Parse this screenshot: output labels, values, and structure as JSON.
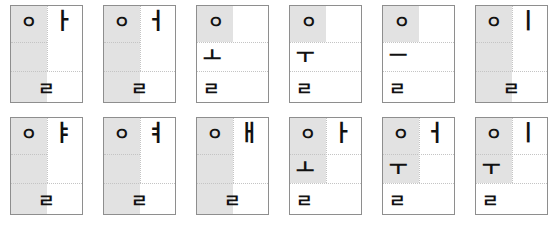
{
  "figure": {
    "rows": 2,
    "columns": 6,
    "shade_color": "#e2e2e2",
    "border_color": "#8e8e8e",
    "guide_color": "#c4c4c4",
    "glyph_color": "#111111"
  },
  "cells": [
    {
      "id": "r1c1",
      "initial": "ㅇ",
      "vowel": "ㅏ",
      "final": "ㄹ",
      "vowel_position": "right",
      "shade": "quad"
    },
    {
      "id": "r1c2",
      "initial": "ㅇ",
      "vowel": "ㅓ",
      "final": "ㄹ",
      "vowel_position": "right",
      "shade": "quad"
    },
    {
      "id": "r1c3",
      "initial": "ㅇ",
      "vowel": "ㅗ",
      "final": "ㄹ",
      "vowel_position": "below",
      "shade": "band-left"
    },
    {
      "id": "r1c4",
      "initial": "ㅇ",
      "vowel": "ㅜ",
      "final": "ㄹ",
      "vowel_position": "below",
      "shade": "band-left"
    },
    {
      "id": "r1c5",
      "initial": "ㅇ",
      "vowel": "ㅡ",
      "final": "ㄹ",
      "vowel_position": "below",
      "shade": "band-left"
    },
    {
      "id": "r1c6",
      "initial": "ㅇ",
      "vowel": "ㅣ",
      "final": "ㄹ",
      "vowel_position": "right",
      "shade": "quad"
    },
    {
      "id": "r2c1",
      "initial": "ㅇ",
      "vowel": "ㅑ",
      "final": "ㄹ",
      "vowel_position": "right",
      "shade": "quad"
    },
    {
      "id": "r2c2",
      "initial": "ㅇ",
      "vowel": "ㅕ",
      "final": "ㄹ",
      "vowel_position": "right",
      "shade": "quad"
    },
    {
      "id": "r2c3",
      "initial": "ㅇ",
      "vowel": "ㅐ",
      "final": "ㄹ",
      "vowel_position": "right",
      "shade": "quad"
    },
    {
      "id": "r2c4",
      "initial": "ㅇ",
      "vowel": "ㅏ",
      "vowel_below": "ㅗ",
      "final": "ㄹ",
      "vowel_position": "compound",
      "shade": "tall-left"
    },
    {
      "id": "r2c5",
      "initial": "ㅇ",
      "vowel": "ㅓ",
      "vowel_below": "ㅜ",
      "final": "ㄹ",
      "vowel_position": "compound",
      "shade": "tall-left"
    },
    {
      "id": "r2c6",
      "initial": "ㅇ",
      "vowel": "ㅣ",
      "vowel_below": "ㅜ",
      "final": "ㄹ",
      "vowel_position": "compound",
      "shade": "tall-left"
    }
  ]
}
